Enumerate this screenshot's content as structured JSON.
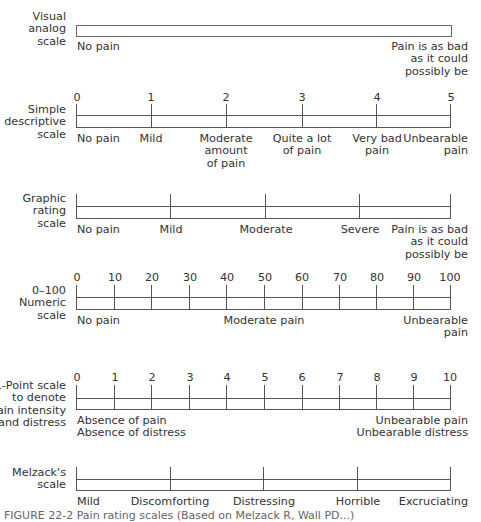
{
  "figure": {
    "caption_partial": "FIGURE 22-2 Pain rating scales (Based on Melzack R, Wall PD...)"
  },
  "scales": {
    "vas": {
      "name_lines": [
        "Visual",
        "analog",
        "scale"
      ],
      "left_anchor": "No pain",
      "right_anchor_lines": [
        "Pain is as bad",
        "as it could",
        "possibly be"
      ]
    },
    "simple_descriptive": {
      "name_lines": [
        "Simple",
        "descriptive",
        "scale"
      ],
      "numbers": [
        "0",
        "1",
        "2",
        "3",
        "4",
        "5"
      ],
      "descriptors": [
        [
          "No pain"
        ],
        [
          "Mild"
        ],
        [
          "Moderate",
          "amount",
          "of pain"
        ],
        [
          "Quite a lot",
          "of pain"
        ],
        [
          "Very bad",
          "pain"
        ],
        [
          "Unbearable",
          "pain"
        ]
      ]
    },
    "graphic_rating": {
      "name_lines": [
        "Graphic",
        "rating",
        "scale"
      ],
      "descriptors": [
        "No pain",
        "Mild",
        "Moderate",
        "Severe"
      ],
      "right_anchor_lines": [
        "Pain is as bad",
        "as it could",
        "possibly be"
      ]
    },
    "numeric_0_100": {
      "name_lines": [
        "0–100",
        "Numeric",
        "scale"
      ],
      "numbers": [
        "0",
        "10",
        "20",
        "30",
        "40",
        "50",
        "60",
        "70",
        "80",
        "90",
        "100"
      ],
      "left_anchor": "No pain",
      "middle_anchor": "Moderate pain",
      "right_anchor_lines": [
        "Unbearable",
        "pain"
      ]
    },
    "eleven_point": {
      "name_lines": [
        "11-Point scale",
        "to denote",
        "pain intensity",
        "and distress"
      ],
      "numbers": [
        "0",
        "1",
        "2",
        "3",
        "4",
        "5",
        "6",
        "7",
        "8",
        "9",
        "10"
      ],
      "left_anchor_lines": [
        "Absence of pain",
        "Absence of distress"
      ],
      "right_anchor_lines": [
        "Unbearable pain",
        "Unbearable distress"
      ]
    },
    "melzack": {
      "name_lines": [
        "Melzack's",
        "scale"
      ],
      "descriptors": [
        "Mild",
        "Discomforting",
        "Distressing",
        "Horrible",
        "Excruciating"
      ]
    }
  }
}
